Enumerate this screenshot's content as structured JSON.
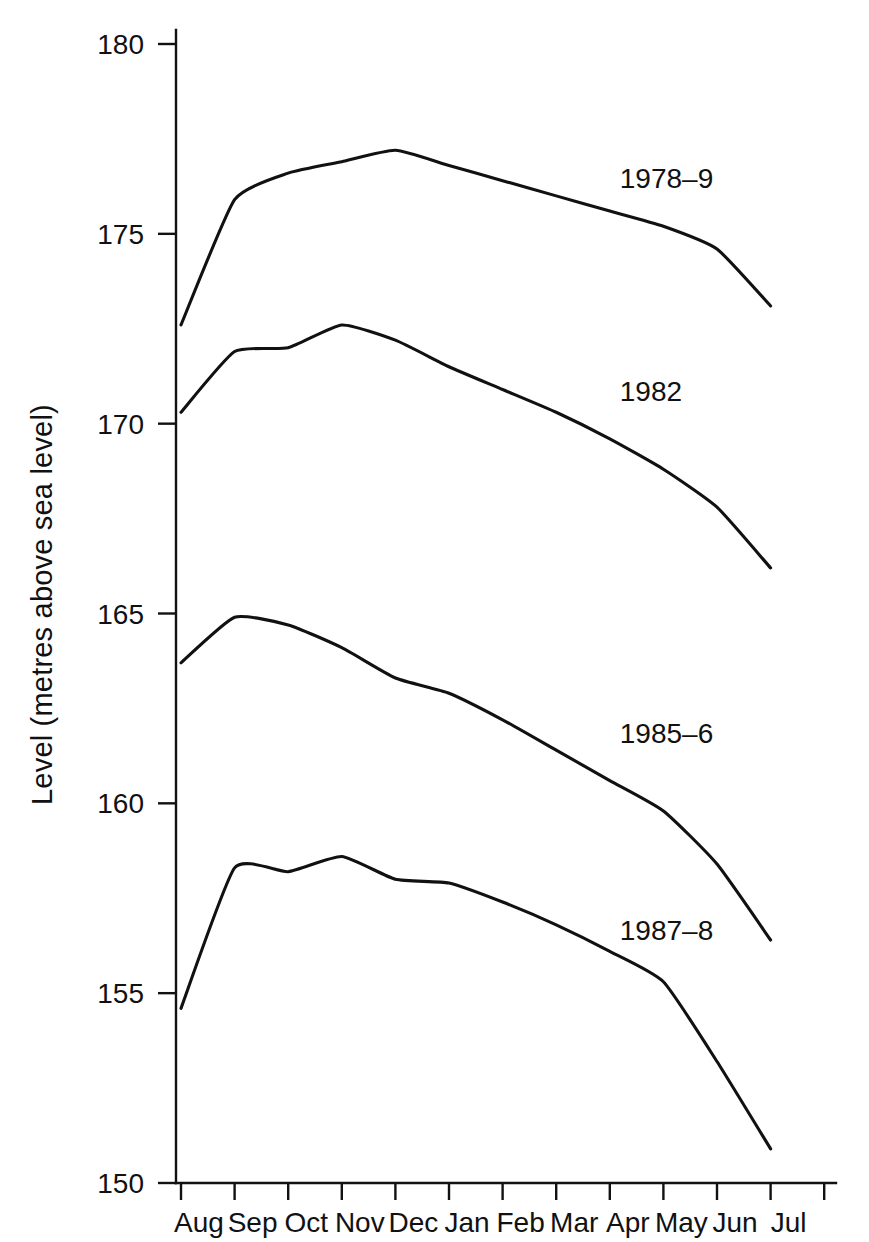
{
  "chart_data": {
    "type": "line",
    "title": "",
    "subtitle": "",
    "xlabel": "",
    "ylabel": "Level  (metres above sea level)",
    "grid": false,
    "legend_position": "inline-annotations",
    "x_categories": [
      "Aug",
      "Sep",
      "Oct",
      "Nov",
      "Dec",
      "Jan",
      "Feb",
      "Mar",
      "Apr",
      "May",
      "Jun",
      "Jul"
    ],
    "x_tick_labels": [
      "Aug",
      "Sep",
      "Oct",
      "Nov",
      "Dec",
      "Jan",
      "Feb",
      "Mar",
      "Apr",
      "May",
      "Jun",
      "Jul"
    ],
    "y_tick_labels": [
      "150",
      "155",
      "160",
      "165",
      "170",
      "175",
      "180"
    ],
    "y_ticks": [
      150,
      155,
      160,
      165,
      170,
      175,
      180
    ],
    "ylim": [
      150,
      180
    ],
    "xlim": [
      "Aug",
      "Jul"
    ],
    "series": [
      {
        "name": "1978-9",
        "label": "1978–9",
        "color": "#111111",
        "annotation_x": "Apr",
        "annotation_value": 176.2,
        "values": [
          172.6,
          175.9,
          176.6,
          176.9,
          177.2,
          176.8,
          176.4,
          176.0,
          175.6,
          175.2,
          174.6,
          173.1
        ]
      },
      {
        "name": "1982",
        "label": "1982",
        "color": "#111111",
        "annotation_x": "Apr",
        "annotation_value": 170.6,
        "values": [
          170.3,
          171.9,
          172.0,
          172.6,
          172.2,
          171.5,
          170.9,
          170.3,
          169.6,
          168.8,
          167.8,
          166.2
        ]
      },
      {
        "name": "1985-6",
        "label": "1985–6",
        "color": "#111111",
        "annotation_x": "Apr",
        "annotation_value": 161.6,
        "values": [
          163.7,
          164.9,
          164.7,
          164.1,
          163.3,
          162.9,
          162.2,
          161.4,
          160.6,
          159.8,
          158.4,
          156.4
        ]
      },
      {
        "name": "1987-8",
        "label": "1987–8",
        "color": "#111111",
        "annotation_x": "Apr",
        "annotation_value": 156.4,
        "values": [
          154.6,
          158.3,
          158.2,
          158.6,
          158.0,
          157.9,
          157.4,
          156.8,
          156.1,
          155.3,
          153.2,
          150.9
        ]
      }
    ]
  },
  "axes": {
    "y_axis_name": "level-axis",
    "x_axis_name": "month-axis"
  }
}
